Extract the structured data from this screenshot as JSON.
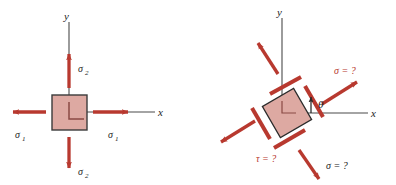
{
  "figure": {
    "colors": {
      "arrow_red": "#b8392f",
      "element_fill": "#dda9a2",
      "element_stroke": "#3b3b3b",
      "axis": "#4a4a4a",
      "text_dark": "#232323",
      "background": "#ffffff"
    },
    "panels": [
      {
        "id": "principal-element",
        "name": "left-diagram",
        "axes": {
          "x_label": "x",
          "y_label": "y"
        },
        "element": {
          "shape": "square",
          "rotation_deg": 0
        },
        "arrows": [
          {
            "id": "sigma1-right",
            "label": "σ1",
            "symbol": "σ",
            "subscript": "1",
            "direction": "right",
            "sense": "tension"
          },
          {
            "id": "sigma1-left",
            "label": "σ1",
            "symbol": "σ",
            "subscript": "1",
            "direction": "left",
            "sense": "tension"
          },
          {
            "id": "sigma2-up",
            "label": "σ2",
            "symbol": "σ",
            "subscript": "2",
            "direction": "up",
            "sense": "tension"
          },
          {
            "id": "sigma2-down",
            "label": "σ2",
            "symbol": "σ",
            "subscript": "2",
            "direction": "down",
            "sense": "tension"
          }
        ]
      },
      {
        "id": "rotated-element",
        "name": "right-diagram",
        "axes": {
          "x_label": "x",
          "y_label": "y"
        },
        "element": {
          "shape": "square",
          "rotation_deg": 30
        },
        "angle": {
          "symbol": "θ",
          "label": "θ",
          "measured_from": "x-axis"
        },
        "arrows": [
          {
            "id": "sigma-upper-right",
            "label": "σ = ?",
            "direction": "up-right",
            "color": "red"
          },
          {
            "id": "sigma-lower-right",
            "label": "σ = ?",
            "direction": "down-right",
            "color": "dark"
          },
          {
            "id": "tau-lower-left",
            "label": "τ = ?",
            "direction": "down-left",
            "color": "red"
          },
          {
            "id": "arrow-upper-left",
            "label": "",
            "direction": "up-left",
            "color": "red"
          }
        ]
      }
    ]
  },
  "labels": {
    "left": {
      "y_axis": "y",
      "x_axis": "x",
      "sigma1_sym": "σ",
      "sigma1_sub": "1",
      "sigma2_sym": "σ",
      "sigma2_sub": "2"
    },
    "right": {
      "y_axis": "y",
      "x_axis": "x",
      "theta": "θ",
      "sigma_top": "σ = ?",
      "sigma_bottom": "σ = ?",
      "tau": "τ = ?"
    }
  }
}
